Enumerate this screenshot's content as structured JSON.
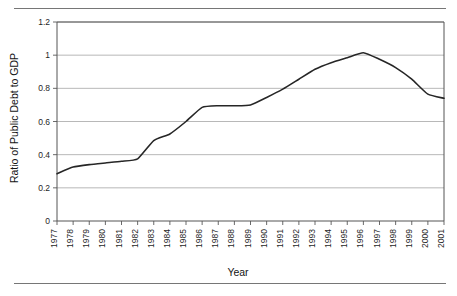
{
  "chart_data": {
    "type": "line",
    "title": "",
    "xlabel": "Year",
    "ylabel": "Ratio of Public Debt to GDP",
    "xlim": [
      1977,
      2001
    ],
    "ylim": [
      0,
      1.2
    ],
    "grid": true,
    "legend": null,
    "y_ticks": [
      "0",
      "0.2",
      "0.4",
      "0.6",
      "0.8",
      "1",
      "1.2"
    ],
    "y_tick_values": [
      0,
      0.2,
      0.4,
      0.6,
      0.8,
      1,
      1.2
    ],
    "x": [
      1977,
      1978,
      1979,
      1980,
      1981,
      1982,
      1983,
      1984,
      1985,
      1986,
      1987,
      1988,
      1989,
      1990,
      1991,
      1992,
      1993,
      1994,
      1995,
      1996,
      1997,
      1998,
      1999,
      2000,
      2001
    ],
    "categories": [
      "1977",
      "1978",
      "1979",
      "1980",
      "1981",
      "1982",
      "1983",
      "1984",
      "1985",
      "1986",
      "1987",
      "1988",
      "1989",
      "1990",
      "1991",
      "1992",
      "1993",
      "1994",
      "1995",
      "1996",
      "1997",
      "1998",
      "1999",
      "2000",
      "2001"
    ],
    "values": [
      0.285,
      0.325,
      0.34,
      0.35,
      0.36,
      0.375,
      0.485,
      0.525,
      0.6,
      0.685,
      0.695,
      0.695,
      0.7,
      0.745,
      0.795,
      0.855,
      0.915,
      0.955,
      0.985,
      1.015,
      0.975,
      0.925,
      0.855,
      0.765,
      0.74
    ],
    "series": [
      {
        "name": "Ratio of Public Debt to GDP",
        "color": "#262626",
        "values": [
          0.285,
          0.325,
          0.34,
          0.35,
          0.36,
          0.375,
          0.485,
          0.525,
          0.6,
          0.685,
          0.695,
          0.695,
          0.7,
          0.745,
          0.795,
          0.855,
          0.915,
          0.955,
          0.985,
          1.015,
          0.975,
          0.925,
          0.855,
          0.765,
          0.74
        ]
      }
    ]
  },
  "figure": {
    "background": "#ffffff",
    "rule_color": "#767676",
    "grid_color": "#9a9a9a",
    "axis_color": "#555555"
  }
}
